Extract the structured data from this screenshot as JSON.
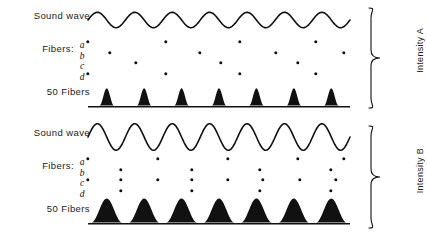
{
  "figure": {
    "background_color": "#ffffff",
    "ink_color": "#111111"
  },
  "panels": [
    {
      "id": "intensity-a",
      "bracket_label": "Intensity A",
      "labels": {
        "sound_wave": "Sound wave",
        "fibers": "Fibers:",
        "fiber_letters": [
          "a",
          "b",
          "c",
          "d"
        ],
        "population": "50 Fibers"
      }
    },
    {
      "id": "intensity-b",
      "bracket_label": "Intensity B",
      "labels": {
        "sound_wave": "Sound wave",
        "fibers": "Fibers:",
        "fiber_letters": [
          "a",
          "b",
          "c",
          "d"
        ],
        "population": "50 Fibers"
      }
    }
  ],
  "chart_data": {
    "type": "line",
    "xlabel": "",
    "ylabel": "",
    "grid": false,
    "legend_position": "right",
    "x_range_px": [
      0,
      262
    ],
    "panels": [
      {
        "name": "Intensity A",
        "sound_wave": {
          "type": "line",
          "waveform": "sine",
          "cycles": 7,
          "amplitude_rel": 0.55,
          "phase_deg": 0,
          "description": "Lower amplitude sinusoid, 7 cycles across the trace"
        },
        "fiber_spikes": {
          "type": "scatter",
          "rows": [
            "a",
            "b",
            "c",
            "d"
          ],
          "note": "Each dot is one action potential, locked near the wave peak; sparse firing at low intensity",
          "row_a_x": [
            0,
            78,
            152,
            228
          ],
          "row_b_x": [
            22,
            112,
            188,
            256
          ],
          "row_c_x": [
            48,
            133,
            210
          ],
          "row_d_x": [
            0,
            78,
            152,
            228
          ]
        },
        "population_histogram": {
          "type": "area",
          "label": "50 Fibers",
          "peaks": 7,
          "peak_width_rel": 0.38,
          "peak_height_rel": 0.72,
          "description": "Narrow, well-separated peaks returning to zero between cycles"
        }
      },
      {
        "name": "Intensity B",
        "sound_wave": {
          "type": "line",
          "waveform": "sine",
          "cycles": 7,
          "amplitude_rel": 0.95,
          "phase_deg": 0,
          "description": "Higher amplitude sinusoid, same 7 cycles"
        },
        "fiber_spikes": {
          "type": "scatter",
          "rows": [
            "a",
            "b",
            "c",
            "d"
          ],
          "note": "Denser firing at high intensity; most cycles evoke a spike in every fiber",
          "row_a_x": [
            0,
            70,
            140,
            210,
            256
          ],
          "row_b_x": [
            33,
            104,
            172,
            243
          ],
          "row_c_x": [
            0,
            33,
            70,
            104,
            140,
            175,
            212,
            248
          ],
          "row_d_x": [
            33,
            104,
            172,
            243
          ]
        },
        "population_histogram": {
          "type": "area",
          "label": "50 Fibers",
          "peaks": 7,
          "peak_width_rel": 0.82,
          "peak_height_rel": 1.0,
          "description": "Broad, tall peaks that nearly merge; troughs stay above zero"
        }
      }
    ]
  }
}
